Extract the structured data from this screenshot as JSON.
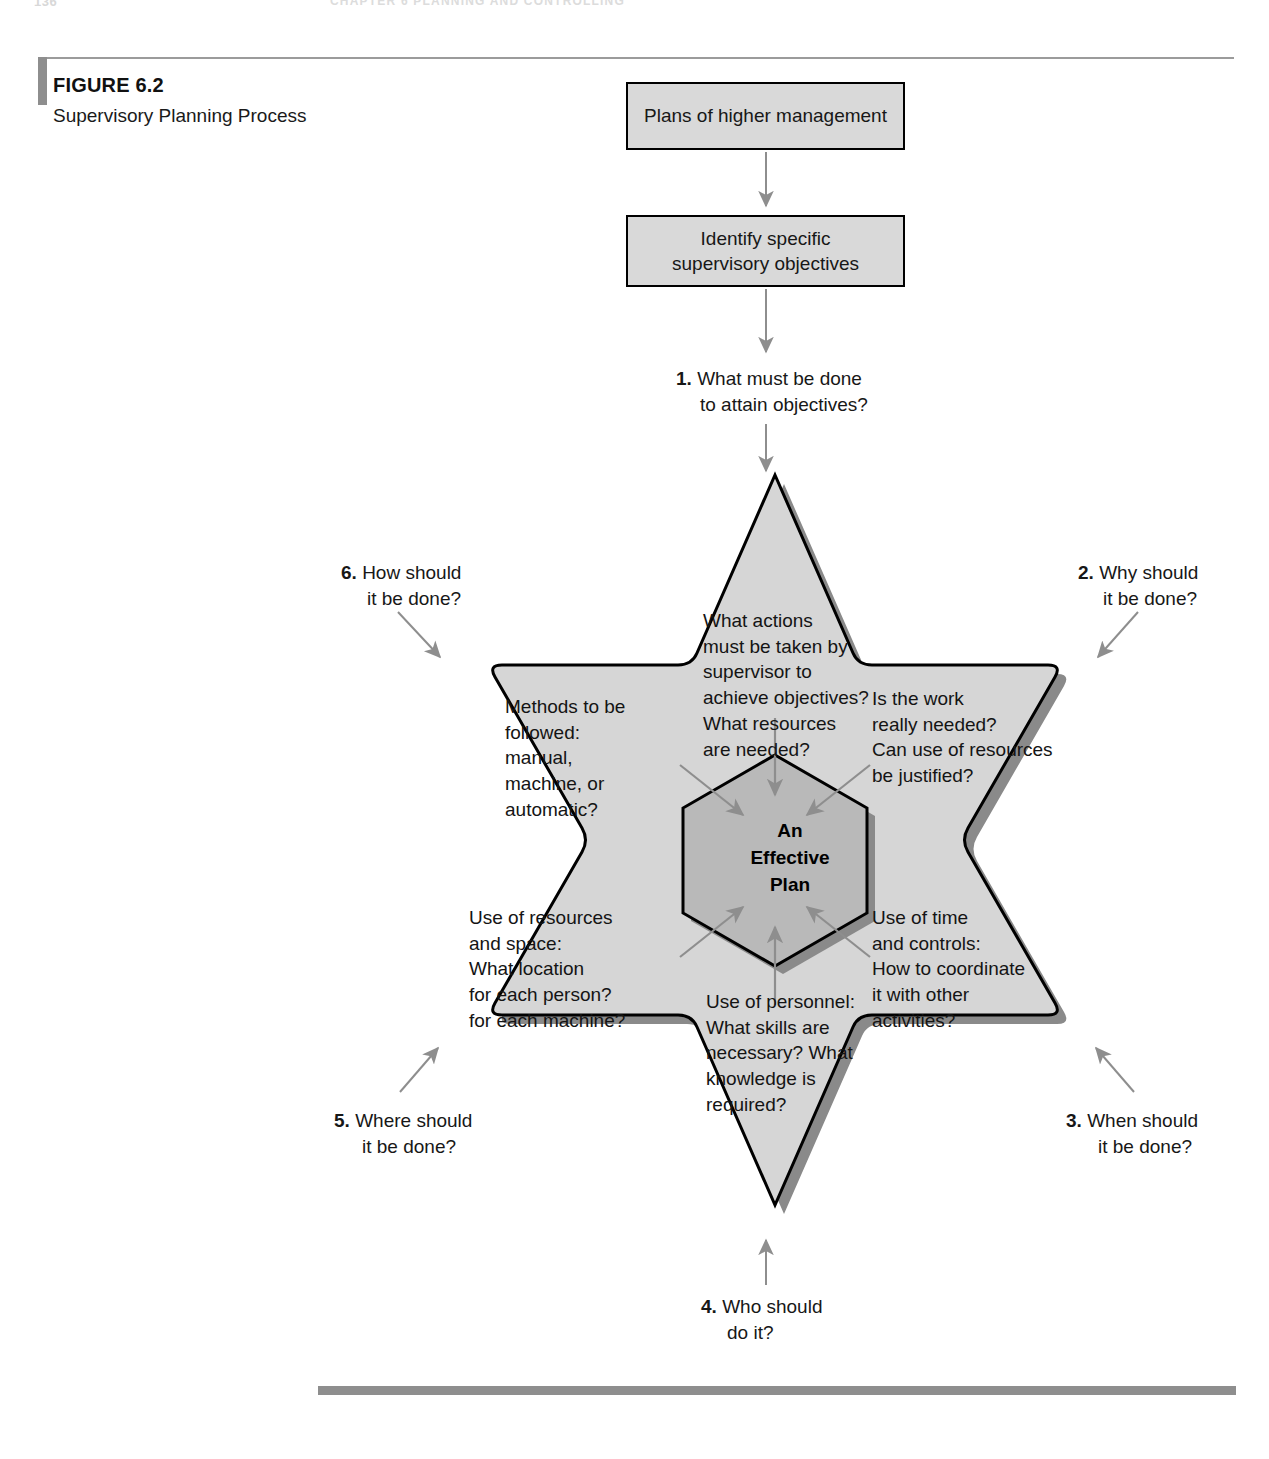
{
  "running_head": {
    "folio": "136",
    "title": "CHAPTER 6    PLANNING AND CONTROLLING"
  },
  "figure": {
    "number": "FIGURE 6.2",
    "title": "Supervisory Planning\nProcess"
  },
  "flow": {
    "box_plans": "Plans of higher management",
    "box_objectives": "Identify specific\nsupervisory objectives"
  },
  "points": [
    {
      "num": "1.",
      "line1": "What must be done",
      "line2": "to attain objectives?"
    },
    {
      "num": "2.",
      "line1": "Why should",
      "line2": "it be done?"
    },
    {
      "num": "3.",
      "line1": "When should",
      "line2": "it be done?"
    },
    {
      "num": "4.",
      "line1": "Who should",
      "line2": "do it?"
    },
    {
      "num": "5.",
      "line1": "Where should",
      "line2": "it be done?"
    },
    {
      "num": "6.",
      "line1": "How should",
      "line2": "it be done?"
    }
  ],
  "star": {
    "center": "An\nEffective\nPlan",
    "sectors": {
      "top": "What actions\nmust be taken by\nsupervisor to\nachieve objectives?\nWhat resources\nare needed?",
      "right": "Is the work\nreally needed?\nCan use of resources\nbe justified?",
      "lower_right": "Use of time\nand controls:\nHow to coordinate\nit with other\nactivities?",
      "bottom": "Use of personnel:\nWhat skills are\nnecessary? What\nknowledge is\nrequired?",
      "lower_left": "Use of resources\nand space:\nWhat location\nfor each person?\nfor each machine?",
      "left": "Methods to be\nfollowed:\nmanual,\nmachine, or\nautomatic?"
    }
  },
  "colors": {
    "star_fill": "#d6d6d6",
    "hex_fill": "#b9b9b9",
    "box_fill": "#d9d9d9",
    "shadow": "#8a8a8a",
    "rule": "#8e8e8e",
    "outline": "#000000",
    "arrow": "#8e8e8e"
  }
}
